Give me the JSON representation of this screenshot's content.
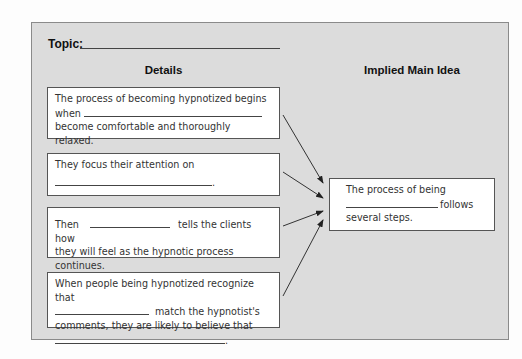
{
  "topic_label": "Topic:",
  "columns": {
    "details": "Details",
    "main_idea": "Implied Main Idea"
  },
  "details": [
    {
      "line1": "The process of becoming hypnotized begins",
      "line2_before": "when",
      "line3": "become comfortable and thoroughly relaxed."
    },
    {
      "line1": "They focus their attention on",
      "line2_after": "."
    },
    {
      "line1_before": "Then",
      "line1_after": "tells the clients how",
      "line2": "they will feel as the hypnotic process continues."
    },
    {
      "line1": "When people being hypnotized recognize that",
      "line2_after": "match the hypnotist's",
      "line3": "comments, they are likely to believe that",
      "line4_after": "."
    }
  ],
  "main_idea": {
    "line1": "The process of being",
    "line2_after": "follows",
    "line3": "several steps."
  },
  "colors": {
    "panel": "#dcdcdc",
    "border": "#555555"
  }
}
